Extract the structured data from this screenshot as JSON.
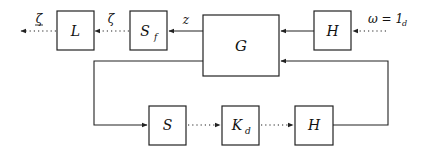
{
  "diagram": {
    "type": "block-diagram",
    "blocks": {
      "L": {
        "label": "L"
      },
      "S_f": {
        "label": "S",
        "subscript": "f"
      },
      "G": {
        "label": "G"
      },
      "H_top": {
        "label": "H"
      },
      "S": {
        "label": "S"
      },
      "K_d": {
        "label": "K",
        "subscript": "d"
      },
      "H_bottom": {
        "label": "H"
      }
    },
    "signals": {
      "zeta_out": {
        "label": "ζ",
        "underline": true
      },
      "zeta": {
        "label": "ζ"
      },
      "z": {
        "label": "z"
      },
      "omega": {
        "label": "ω = 1",
        "subscript": "d"
      }
    },
    "connections": [
      {
        "from": "omega",
        "to": "H_top",
        "style": "dotted"
      },
      {
        "from": "H_top",
        "to": "G",
        "style": "solid"
      },
      {
        "from": "G",
        "to": "S_f",
        "style": "solid",
        "signal": "z"
      },
      {
        "from": "S_f",
        "to": "L",
        "style": "dotted",
        "signal": "ζ"
      },
      {
        "from": "L",
        "to": "output",
        "style": "dotted",
        "signal": "ζ (underlined)"
      },
      {
        "from": "G",
        "to": "S",
        "style": "solid"
      },
      {
        "from": "S",
        "to": "K_d",
        "style": "dotted"
      },
      {
        "from": "K_d",
        "to": "H_bottom",
        "style": "dotted"
      },
      {
        "from": "H_bottom",
        "to": "G",
        "style": "solid"
      }
    ]
  }
}
